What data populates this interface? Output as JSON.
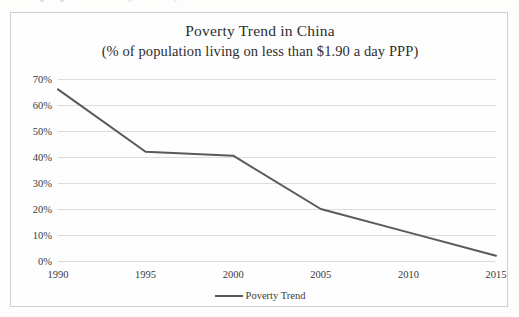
{
  "chart_data": {
    "type": "line",
    "title": "Poverty Trend in China",
    "subtitle": "(% of population living on less than $1.90 a day PPP)",
    "xlabel": "",
    "ylabel": "",
    "categories": [
      "1990",
      "1995",
      "2000",
      "2005",
      "2010",
      "2015"
    ],
    "x": [
      1990,
      1995,
      2000,
      2005,
      2010,
      2015
    ],
    "series": [
      {
        "name": "Poverty Trend",
        "values": [
          66,
          42,
          40.5,
          20,
          11,
          2
        ],
        "color": "#595959"
      }
    ],
    "ylim": [
      0,
      70
    ],
    "ytick_values": [
      0,
      10,
      20,
      30,
      40,
      50,
      60,
      70
    ],
    "ytick_labels": [
      "0%",
      "10%",
      "20%",
      "30%",
      "40%",
      "50%",
      "60%",
      "70%"
    ],
    "xtick_labels": [
      "1990",
      "1995",
      "2000",
      "2005",
      "2010",
      "2015"
    ],
    "grid": true,
    "grid_axis": "y",
    "grid_color": "#dcdcdc",
    "legend": true,
    "legend_position": "bottom-center",
    "legend_entries": [
      "Poverty Trend"
    ],
    "border_color": "#cfcfcf",
    "text_color": "#3a3a3a",
    "background_color": "#fefefe"
  }
}
